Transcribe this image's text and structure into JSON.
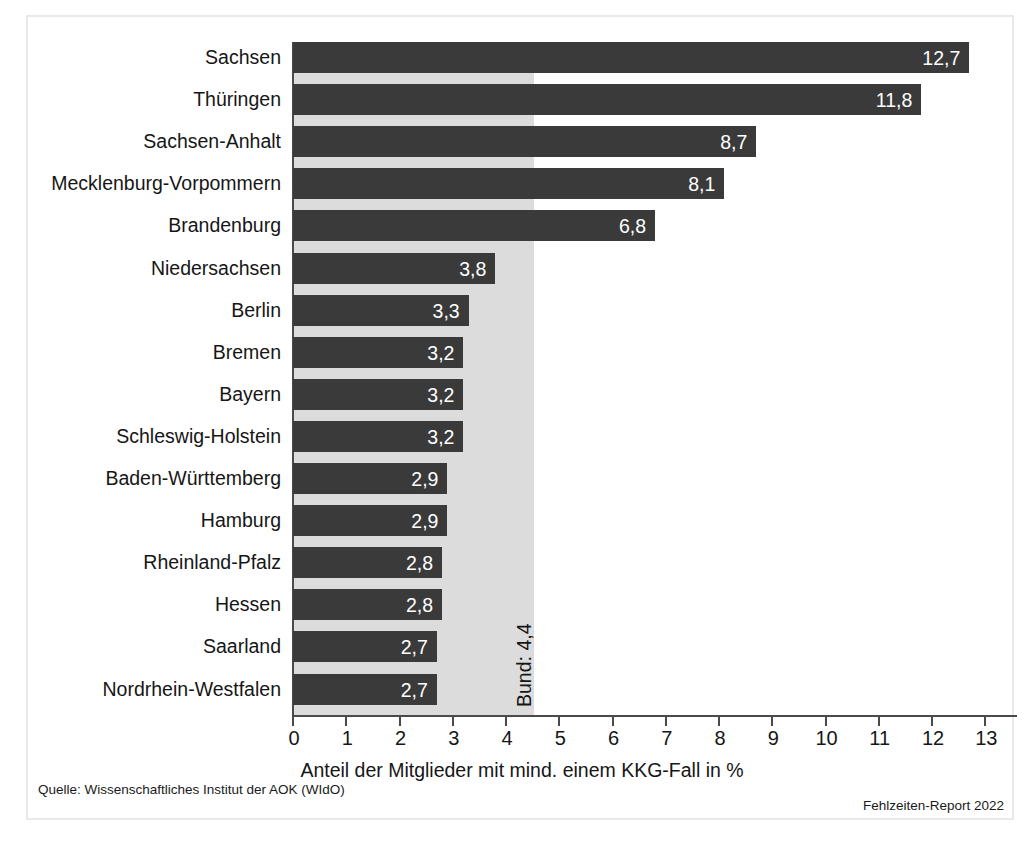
{
  "chart_data": {
    "type": "bar",
    "orientation": "horizontal",
    "title": "",
    "xlabel": "Anteil der Mitglieder mit mind. einem KKG-Fall in %",
    "ylabel": "",
    "xlim": [
      0,
      13
    ],
    "xticks": [
      "0",
      "1",
      "2",
      "3",
      "4",
      "5",
      "6",
      "7",
      "8",
      "9",
      "10",
      "11",
      "12",
      "13"
    ],
    "grid": false,
    "legend": null,
    "categories": [
      "Sachsen",
      "Thüringen",
      "Sachsen-Anhalt",
      "Mecklenburg-Vorpommern",
      "Brandenburg",
      "Niedersachsen",
      "Berlin",
      "Bremen",
      "Bayern",
      "Schleswig-Holstein",
      "Baden-Württemberg",
      "Hamburg",
      "Rheinland-Pfalz",
      "Hessen",
      "Saarland",
      "Nordrhein-Westfalen"
    ],
    "values": [
      12.7,
      11.8,
      8.7,
      8.1,
      6.8,
      3.8,
      3.3,
      3.2,
      3.2,
      3.2,
      2.9,
      2.9,
      2.8,
      2.8,
      2.7,
      2.7
    ],
    "value_labels": [
      "12,7",
      "11,8",
      "8,7",
      "8,1",
      "6,8",
      "3,8",
      "3,3",
      "3,2",
      "3,2",
      "3,2",
      "2,9",
      "2,9",
      "2,8",
      "2,8",
      "2,7",
      "2,7"
    ],
    "annotations": [
      {
        "name": "bund-reference",
        "label": "Bund: 4,4",
        "value": 4.4,
        "orientation": "vertical"
      }
    ],
    "colors": {
      "bar": "#3a3a3a",
      "reference_band": "#dcdcdc",
      "axis": "#4a4a4a",
      "value_label": "#ffffff",
      "text": "#161616",
      "frame": "#e9e9e9",
      "background": "#ffffff"
    }
  },
  "footer": {
    "source": "Quelle: Wissenschaftliches Institut der AOK (WIdO)",
    "report": "Fehlzeiten-Report 2022"
  }
}
